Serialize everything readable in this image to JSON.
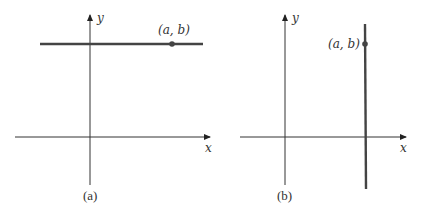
{
  "figure": {
    "panels": [
      {
        "id": "a",
        "caption": "(a)",
        "x_axis_label": "x",
        "y_axis_label": "y",
        "line_type": "horizontal",
        "line_description": "horizontal line through (a, b)",
        "point_label": "(a, b)"
      },
      {
        "id": "b",
        "caption": "(b)",
        "x_axis_label": "x",
        "y_axis_label": "y",
        "line_type": "vertical",
        "line_description": "vertical line through (a, b)",
        "point_label": "(a, b)"
      }
    ],
    "colors": {
      "axis": "#333333",
      "line": "#444444",
      "point": "#444444",
      "text": "#333333",
      "background": "#ffffff"
    }
  }
}
